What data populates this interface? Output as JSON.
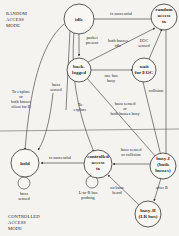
{
  "modes": {
    "random": [
      "RANDOM",
      "ACCESS",
      "MODE"
    ],
    "controlled": [
      "CONTROLLED",
      "ACCESS",
      "MODE"
    ]
  },
  "states": {
    "idle": [
      "idle"
    ],
    "random_tx": [
      "random",
      "access",
      "tx"
    ],
    "backlogged": [
      "back-",
      "logged"
    ],
    "wait_eoc": [
      "wait",
      "for EOC"
    ],
    "hold": [
      "hold"
    ],
    "controlled_tx": [
      "controlled",
      "access",
      "tx"
    ],
    "busy1": [
      "busy-I",
      "(both",
      "busses)"
    ],
    "busy2": [
      "busy-II",
      "(LR bus)"
    ]
  },
  "labels": {
    "tx_successful_top": [
      "tx successful"
    ],
    "packet_present": [
      "packet",
      "present"
    ],
    "both_busses_idle": [
      "both busses",
      "idle"
    ],
    "eoc_sensed": [
      "EOC",
      "sensed"
    ],
    "one_bus_busy": [
      "one bus",
      "busy"
    ],
    "collision": [
      "collision"
    ],
    "buzz_sensed_or_both": [
      "buzz sensed",
      "or",
      "both  busses busy"
    ],
    "to_explore_left": [
      "To explore",
      "or",
      "both busses",
      "silent for B"
    ],
    "buzz_sensed_mid": [
      "buzz",
      "sensed"
    ],
    "to_explore_mid": [
      "To",
      "explore"
    ],
    "tx_successful_bottom": [
      "tx successful"
    ],
    "buzz_sensed_or_collision": [
      "buzz sensed",
      "or collision"
    ],
    "buzz_sensed_hold": [
      "buzz",
      "sensed"
    ],
    "l_to_r_polling": [
      "L-to-R bus",
      "probing"
    ],
    "no_buzz_heard": [
      "no buzz",
      "heard"
    ],
    "after_b": [
      "after B"
    ]
  }
}
